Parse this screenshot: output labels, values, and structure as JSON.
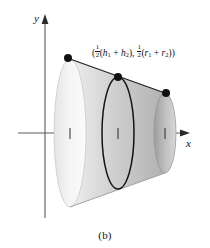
{
  "figure": {
    "caption": "(b)",
    "axes": {
      "y_label": "y",
      "x_label": "x",
      "x_axis_y": 133,
      "y_axis_x": 45,
      "tick_positions": [
        70,
        118,
        165
      ]
    },
    "point_label": {
      "full_text": "(½(h₁ + h₂), ½(r₁ + r₂))",
      "open_paren": "(",
      "first_coord": {
        "fraction_numerator": "1",
        "fraction_denominator": "2",
        "expression_open": "(",
        "term1_base": "h",
        "term1_sub": "1",
        "operator": "+",
        "term2_base": "h",
        "term2_sub": "2",
        "expression_close": ")"
      },
      "separator": ", ",
      "second_coord": {
        "fraction_numerator": "1",
        "fraction_denominator": "2",
        "expression_open": "(",
        "term1_base": "r",
        "term1_sub": "1",
        "operator": "+",
        "term2_base": "r",
        "term2_sub": "2",
        "expression_close": ")"
      },
      "close_paren": ")"
    },
    "shape": {
      "type": "frustum",
      "description": "truncated cone (frustum) shaded with left-to-right gradient",
      "left_cap_center_x": 70,
      "left_cap_center_y": 133,
      "left_cap_rx": 16,
      "left_cap_ry": 74,
      "right_cap_center_x": 165,
      "right_cap_center_y": 133,
      "right_cap_rx": 11,
      "right_cap_ry": 40,
      "mid_ellipse_center_x": 118,
      "mid_ellipse_center_y": 133,
      "mid_ellipse_rx": 16,
      "mid_ellipse_ry": 56
    },
    "points": [
      {
        "name": "left-top-point",
        "x": 68,
        "y": 58
      },
      {
        "name": "mid-top-point",
        "x": 118,
        "y": 77
      },
      {
        "name": "right-top-point",
        "x": 166,
        "y": 93
      }
    ],
    "colors": {
      "stroke": "#111111",
      "axis": "#555555",
      "surface_light": "#f4f4f4",
      "surface_mid": "#d2d2d2",
      "surface_dark": "#a8a8a8",
      "cap_light": "#ededed",
      "cap_dark": "#b9b9b9",
      "background": "#ffffff"
    }
  }
}
